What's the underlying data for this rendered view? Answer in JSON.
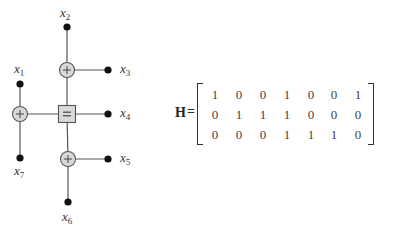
{
  "diagram": {
    "type": "tanner-graph",
    "variables": [
      {
        "id": "x1",
        "base": "x",
        "sub": "1",
        "x": 20,
        "y": 84,
        "label_x": 14,
        "label_y": 62
      },
      {
        "id": "x2",
        "base": "x",
        "sub": "2",
        "x": 67,
        "y": 27,
        "label_x": 60,
        "label_y": 6
      },
      {
        "id": "x3",
        "base": "x",
        "sub": "3",
        "x": 108,
        "y": 70,
        "label_x": 120,
        "label_y": 62
      },
      {
        "id": "x4",
        "base": "x",
        "sub": "4",
        "x": 108,
        "y": 114,
        "label_x": 120,
        "label_y": 106
      },
      {
        "id": "x5",
        "base": "x",
        "sub": "5",
        "x": 108,
        "y": 159,
        "label_x": 120,
        "label_y": 151
      },
      {
        "id": "x6",
        "base": "x",
        "sub": "6",
        "x": 68,
        "y": 202,
        "label_x": 62,
        "label_y": 210
      },
      {
        "id": "x7",
        "base": "x",
        "sub": "7",
        "x": 20,
        "y": 158,
        "label_x": 14,
        "label_y": 164
      }
    ],
    "check_nodes": [
      {
        "id": "c1",
        "kind": "parity",
        "symbol": "+",
        "x": 67,
        "y": 70
      },
      {
        "id": "c2",
        "kind": "parity",
        "symbol": "+",
        "x": 20,
        "y": 114
      },
      {
        "id": "c3",
        "kind": "parity",
        "symbol": "+",
        "x": 68,
        "y": 159
      }
    ],
    "equality_nodes": [
      {
        "id": "e1",
        "symbol": "=",
        "x": 67,
        "y": 114
      }
    ],
    "edges": [
      [
        "x2",
        "c1"
      ],
      [
        "c1",
        "x3"
      ],
      [
        "c1",
        "e1"
      ],
      [
        "x1",
        "c2"
      ],
      [
        "c2",
        "x7"
      ],
      [
        "c2",
        "e1"
      ],
      [
        "e1",
        "x4"
      ],
      [
        "e1",
        "c3"
      ],
      [
        "c3",
        "x5"
      ],
      [
        "c3",
        "x6"
      ]
    ],
    "colors": {
      "line": "#555555",
      "node_fill": "#d9d9d9",
      "node_stroke": "#555555",
      "dot": "#111111"
    }
  },
  "matrix": {
    "name": "H",
    "equals": "=",
    "rows": [
      [
        "1",
        "0",
        "0",
        "1",
        "0",
        "0",
        "1"
      ],
      [
        "0",
        "1",
        "1",
        "1",
        "0",
        "0",
        "0"
      ],
      [
        "0",
        "0",
        "0",
        "1",
        "1",
        "1",
        "0"
      ]
    ]
  }
}
